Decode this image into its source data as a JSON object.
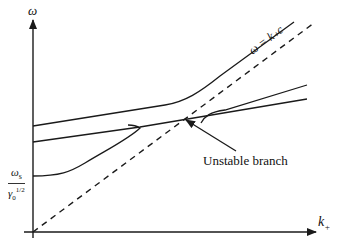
{
  "diagram": {
    "type": "dispersion-relation",
    "y_axis_label": "ω",
    "x_axis_label": "k",
    "x_axis_label_sub": "+",
    "asymptote_label": "ω = k₊c",
    "y_intercept_label_num": "ωs",
    "y_intercept_label_num_main": "ω",
    "y_intercept_label_num_sub": "s",
    "y_intercept_label_den_main": "γ",
    "y_intercept_label_den_sub": "0",
    "y_intercept_label_den_sup": "1/2",
    "annotation": "Unstable branch",
    "line_color": "#1a1a1a",
    "background": "#ffffff"
  }
}
